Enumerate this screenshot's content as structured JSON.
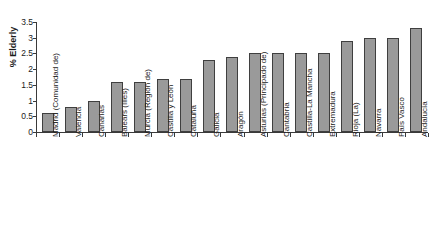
{
  "chart_data": {
    "type": "bar",
    "title": "",
    "xlabel": "",
    "ylabel": "% Elderly",
    "ylim": [
      0,
      3.5
    ],
    "ytick_values": [
      0,
      0.5,
      1,
      1.5,
      2,
      2.5,
      3,
      3.5
    ],
    "ytick_labels": [
      "0",
      "0.5",
      "1",
      "1.5",
      "2",
      "2.5",
      "3",
      "3.5"
    ],
    "grid": false,
    "legend": false,
    "bar_color": "#9a9a9a",
    "bar_edge_color": "#3f3f3f",
    "axis_color": "#3a3a3a",
    "categories": [
      "Madrid (Comunidad de)",
      "Valencia",
      "Canarias",
      "Balears (Illes)",
      "Murcia (Región de)",
      "Castilla y León",
      "Cataluña",
      "Galicia",
      "Aragón",
      "Asturias (Principado de)",
      "Cantabria",
      "Castilla-La Mancha",
      "Extremadura",
      "Rioja (La)",
      "Navarra",
      "País Vasco",
      "Andalucía"
    ],
    "values": [
      0.6,
      0.8,
      1.0,
      1.6,
      1.6,
      1.7,
      1.7,
      2.3,
      2.4,
      2.5,
      2.5,
      2.5,
      2.5,
      2.9,
      3.0,
      3.0,
      3.3
    ]
  }
}
